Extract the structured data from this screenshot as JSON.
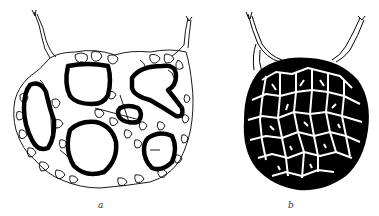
{
  "figure": {
    "panels": [
      {
        "id": "a",
        "label": "a",
        "description": "Network of thin-walled cells surrounding six thick-walled open spaces, with two thin vessels exiting at top"
      },
      {
        "id": "b",
        "label": "b",
        "description": "Dense dark rounded mass covered by a white reticular network, with two vessels exiting at top"
      }
    ],
    "colors": {
      "ink": "#000000",
      "paper": "#ffffff"
    }
  }
}
